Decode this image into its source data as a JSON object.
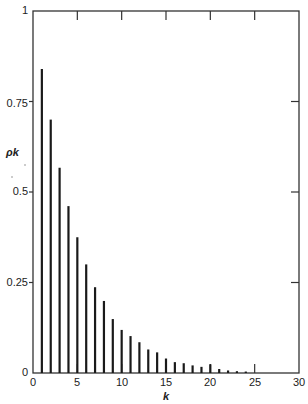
{
  "chart_data": {
    "type": "bar",
    "style": "stem/spike plot (autocorrelation function)",
    "title": "",
    "xlabel": "k",
    "ylabel": "ρ_k",
    "ylabel_display": "ρk",
    "xlim": [
      0,
      30
    ],
    "ylim": [
      0,
      1
    ],
    "grid": false,
    "legend": null,
    "x_ticks": [
      0,
      5,
      10,
      15,
      20,
      25,
      30
    ],
    "x_tick_labels": [
      "0",
      "5",
      "10",
      "15",
      "20",
      "25",
      "30"
    ],
    "y_ticks": [
      0,
      0.25,
      0.5,
      0.75,
      1
    ],
    "y_tick_labels": [
      "0",
      "0.25",
      "0.5",
      "0.75",
      "1"
    ],
    "x": [
      1,
      2,
      3,
      4,
      5,
      6,
      7,
      8,
      9,
      10,
      11,
      12,
      13,
      14,
      15,
      16,
      17,
      18,
      19,
      20,
      21,
      22,
      23,
      24
    ],
    "values": [
      0.84,
      0.7,
      0.567,
      0.461,
      0.375,
      0.3,
      0.237,
      0.199,
      0.149,
      0.119,
      0.102,
      0.085,
      0.065,
      0.057,
      0.04,
      0.03,
      0.027,
      0.021,
      0.017,
      0.024,
      0.011,
      0.007,
      0.005,
      0.004
    ],
    "colors": {
      "bars": "#1a1a1a",
      "axes": "#333333",
      "background": "#ffffff"
    }
  },
  "labels": {
    "y_axis": "ρk",
    "x_axis": "k",
    "y_ticks": [
      "0",
      "0.25",
      "0.5",
      "0.75",
      "1"
    ],
    "x_ticks": [
      "0",
      "5",
      "10",
      "15",
      "20",
      "25",
      "30"
    ]
  }
}
